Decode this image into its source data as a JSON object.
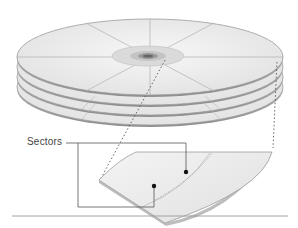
{
  "figure": {
    "callout_label": "Sectors",
    "platter_count": 4,
    "sectors_per_platter": 8,
    "colors": {
      "platter_fill": "#efefef",
      "platter_edge": "#9a9a9a",
      "hub_fill": "#d8d8d8",
      "leader_line": "#555555",
      "dot": "#111111",
      "rule": "#9a9a9a"
    }
  }
}
